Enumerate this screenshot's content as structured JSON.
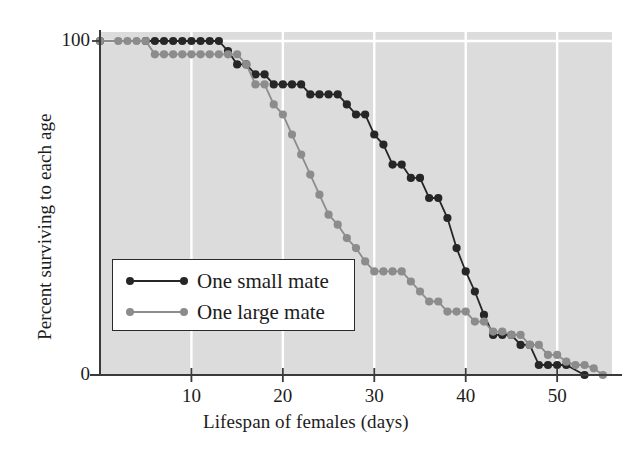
{
  "figure": {
    "background": "#ffffff",
    "plot_background": "#dcdcdc",
    "grid_color": "#ffffff",
    "axis_color": "#3a3a3a"
  },
  "axes": {
    "x_title": "Lifespan of females (days)",
    "y_title": "Percent surviving to each age",
    "x_ticks": [
      "10",
      "20",
      "30",
      "40",
      "50"
    ],
    "y_ticks": [
      "0",
      "100"
    ]
  },
  "legend": {
    "entries": [
      {
        "label": "One small mate",
        "color": "#262626"
      },
      {
        "label": "One large mate",
        "color": "#8c8c8c"
      }
    ]
  },
  "chart_data": {
    "type": "line",
    "title": "",
    "xlabel": "Lifespan of females (days)",
    "ylabel": "Percent surviving to each age",
    "xlim": [
      0,
      56
    ],
    "ylim": [
      0,
      100
    ],
    "xticks": [
      10,
      20,
      30,
      40,
      50
    ],
    "yticks": [
      0,
      100
    ],
    "grid": "vertical white gridlines at x ticks plus one horizontal line at y=100",
    "legend_position": "inside lower-left",
    "series": [
      {
        "name": "One small mate",
        "color": "#262626",
        "marker": "filled-circle",
        "points": [
          [
            0,
            100
          ],
          [
            5,
            100
          ],
          [
            6,
            100
          ],
          [
            7,
            100
          ],
          [
            8,
            100
          ],
          [
            9,
            100
          ],
          [
            10,
            100
          ],
          [
            11,
            100
          ],
          [
            12,
            100
          ],
          [
            13,
            100
          ],
          [
            14,
            97
          ],
          [
            15,
            93
          ],
          [
            16,
            93
          ],
          [
            17,
            90
          ],
          [
            18,
            90
          ],
          [
            19,
            87
          ],
          [
            20,
            87
          ],
          [
            21,
            87
          ],
          [
            22,
            87
          ],
          [
            23,
            84
          ],
          [
            24,
            84
          ],
          [
            25,
            84
          ],
          [
            26,
            84
          ],
          [
            27,
            81
          ],
          [
            28,
            78
          ],
          [
            29,
            78
          ],
          [
            30,
            72
          ],
          [
            31,
            69
          ],
          [
            32,
            63
          ],
          [
            33,
            63
          ],
          [
            34,
            59
          ],
          [
            35,
            59
          ],
          [
            36,
            53
          ],
          [
            37,
            53
          ],
          [
            38,
            47
          ],
          [
            39,
            38
          ],
          [
            40,
            31
          ],
          [
            41,
            25
          ],
          [
            42,
            18
          ],
          [
            43,
            12
          ],
          [
            44,
            12
          ],
          [
            45,
            12
          ],
          [
            46,
            9
          ],
          [
            47,
            9
          ],
          [
            48,
            3
          ],
          [
            49,
            3
          ],
          [
            50,
            3
          ],
          [
            51,
            3
          ],
          [
            53,
            0
          ]
        ]
      },
      {
        "name": "One large mate",
        "color": "#8c8c8c",
        "marker": "filled-circle",
        "points": [
          [
            0,
            100
          ],
          [
            2,
            100
          ],
          [
            3,
            100
          ],
          [
            4,
            100
          ],
          [
            5,
            100
          ],
          [
            6,
            96
          ],
          [
            7,
            96
          ],
          [
            8,
            96
          ],
          [
            9,
            96
          ],
          [
            10,
            96
          ],
          [
            11,
            96
          ],
          [
            12,
            96
          ],
          [
            13,
            96
          ],
          [
            14,
            96
          ],
          [
            15,
            96
          ],
          [
            16,
            93
          ],
          [
            17,
            87
          ],
          [
            18,
            87
          ],
          [
            19,
            81
          ],
          [
            20,
            78
          ],
          [
            21,
            72
          ],
          [
            22,
            66
          ],
          [
            23,
            60
          ],
          [
            24,
            54
          ],
          [
            25,
            48
          ],
          [
            26,
            45
          ],
          [
            27,
            41
          ],
          [
            28,
            38
          ],
          [
            29,
            34
          ],
          [
            30,
            31
          ],
          [
            31,
            31
          ],
          [
            32,
            31
          ],
          [
            33,
            31
          ],
          [
            34,
            28
          ],
          [
            35,
            25
          ],
          [
            36,
            22
          ],
          [
            37,
            22
          ],
          [
            38,
            19
          ],
          [
            39,
            19
          ],
          [
            40,
            19
          ],
          [
            41,
            16
          ],
          [
            42,
            16
          ],
          [
            43,
            13
          ],
          [
            44,
            13
          ],
          [
            45,
            12
          ],
          [
            46,
            12
          ],
          [
            47,
            9
          ],
          [
            48,
            9
          ],
          [
            49,
            6
          ],
          [
            50,
            6
          ],
          [
            51,
            4
          ],
          [
            52,
            3
          ],
          [
            53,
            3
          ],
          [
            54,
            2
          ],
          [
            55,
            0
          ]
        ]
      }
    ]
  }
}
